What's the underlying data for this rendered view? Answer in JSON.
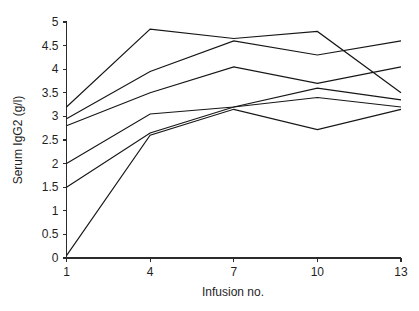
{
  "chart_data": {
    "type": "line",
    "title": "",
    "subtitle": "",
    "xlabel": "Infusion no.",
    "ylabel": "Serum IgG2 (g/l)",
    "x": [
      1,
      4,
      7,
      10,
      13
    ],
    "xtick_labels": [
      "1",
      "4",
      "7",
      "10",
      "13"
    ],
    "ytick_labels": [
      "0",
      "0.5",
      "1",
      "1.5",
      "2",
      "2.5",
      "3",
      "3.5",
      "4",
      "4.5",
      "5"
    ],
    "ytick_values": [
      0,
      0.5,
      1,
      1.5,
      2,
      2.5,
      3,
      3.5,
      4,
      4.5,
      5
    ],
    "xlim": [
      1,
      13
    ],
    "ylim": [
      0,
      5
    ],
    "grid": false,
    "legend": false,
    "legend_position": "none",
    "markers": false,
    "line_color": "#161616",
    "background_color": "#ffffff",
    "series": [
      {
        "name": "patient-1",
        "values": [
          3.2,
          4.85,
          4.65,
          4.8,
          3.5
        ]
      },
      {
        "name": "patient-2",
        "values": [
          2.95,
          3.95,
          4.6,
          4.3,
          4.6
        ]
      },
      {
        "name": "patient-3",
        "values": [
          2.8,
          3.5,
          4.05,
          3.7,
          4.05
        ]
      },
      {
        "name": "patient-4",
        "values": [
          2.0,
          3.05,
          3.2,
          3.6,
          3.35
        ]
      },
      {
        "name": "patient-5",
        "values": [
          1.5,
          2.65,
          3.2,
          3.4,
          3.2
        ]
      },
      {
        "name": "patient-6",
        "values": [
          0.05,
          2.6,
          3.15,
          2.72,
          3.15
        ]
      }
    ]
  },
  "axes": {
    "x_axis_name": "Infusion no.",
    "y_axis_name": "Serum IgG2 (g/l)"
  }
}
